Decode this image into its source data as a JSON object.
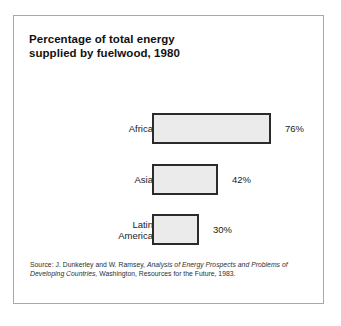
{
  "figure": {
    "title_lines": [
      "Percentage of total energy",
      "supplied by fuelwood, 1980"
    ],
    "background_color": "#ffffff",
    "frame_color": "#a8a8a8",
    "bar_fill_color": "#ebebeb",
    "bar_border_color": "#2b2b2b"
  },
  "source": {
    "prefix": "Source:  J. Dunkerley and W. Ramsey, ",
    "italic_title": "Analysis of Energy Prospects and Problems of Developing Countries,",
    "suffix": " Washington, Resources for the Future, 1983."
  },
  "chart_data": {
    "type": "bar",
    "orientation": "horizontal",
    "title": "Percentage of total energy supplied by fuelwood, 1980",
    "xlabel": "",
    "ylabel": "",
    "xlim": [
      0,
      76
    ],
    "grid": false,
    "legend": "none",
    "categories": [
      "Africa",
      "Asia",
      "Latin America"
    ],
    "values": [
      76,
      42,
      30
    ],
    "value_labels": [
      "76%",
      "42%",
      "30%"
    ],
    "units": "percent",
    "bars": [
      {
        "category": "Africa",
        "category_lines": [
          "Africa"
        ],
        "value": 76,
        "value_label": "76%"
      },
      {
        "category": "Asia",
        "category_lines": [
          "Asia"
        ],
        "value": 42,
        "value_label": "42%"
      },
      {
        "category": "Latin America",
        "category_lines": [
          "Latin",
          "America"
        ],
        "value": 30,
        "value_label": "30%"
      }
    ]
  }
}
